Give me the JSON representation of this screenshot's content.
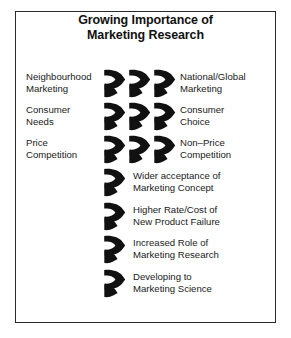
{
  "figure": {
    "title": {
      "line1": "Growing Importance of",
      "line2": "Marketing Research"
    },
    "border_color": "#2b2b2b",
    "arrow_color": "#111111",
    "background": "#ffffff"
  },
  "progression_rows": [
    {
      "from_line1": "Neighbourhood",
      "from_line2": "Marketing",
      "arrow_count": 3,
      "to_line1": "National/Global",
      "to_line2": "Marketing"
    },
    {
      "from_line1": "Consumer",
      "from_line2": "Needs",
      "arrow_count": 3,
      "to_line1": "Consumer",
      "to_line2": "Choice"
    },
    {
      "from_line1": "Price",
      "from_line2": "Competition",
      "arrow_count": 3,
      "to_line1": "Non–Price",
      "to_line2": "Competition"
    }
  ],
  "outcome_rows": [
    {
      "arrow_count": 1,
      "line1": "Wider acceptance of",
      "line2": "Marketing Concept"
    },
    {
      "arrow_count": 1,
      "line1": "Higher Rate/Cost of",
      "line2": "New Product Failure"
    },
    {
      "arrow_count": 1,
      "line1": "Increased Role of",
      "line2": "Marketing Research"
    },
    {
      "arrow_count": 1,
      "line1": "Developing to",
      "line2": "Marketing Science"
    }
  ],
  "icons": {
    "arrow": "crescent-arrow-icon"
  }
}
